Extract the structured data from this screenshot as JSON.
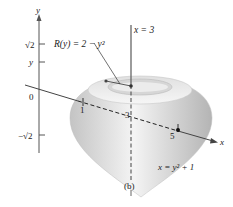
{
  "figure": {
    "caption": "(b)",
    "colors": {
      "axis": "#555555",
      "solid_light": "#f4f4f4",
      "solid_dark": "#b8b8b8",
      "text": "#222222"
    },
    "y_axis": {
      "label": "y",
      "ticks": [
        "√2",
        "y",
        "0",
        "−√2"
      ]
    },
    "x_axis": {
      "label": "x",
      "ticks": [
        "1",
        "3",
        "5"
      ]
    },
    "annotations": {
      "radius": "R(y) = 2 − y²",
      "line": "x = 3",
      "curve": "x = y² + 1"
    }
  }
}
